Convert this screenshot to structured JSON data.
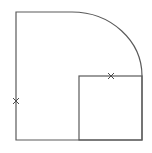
{
  "diagram": {
    "colors": {
      "background": "#ffffff",
      "line": "#5a5a5a",
      "marker": "#4a4a4a"
    },
    "stroke_width": 1.2,
    "outer_shape": {
      "top_left": [
        16,
        12
      ],
      "arc_start": [
        72,
        12
      ],
      "arc_end": [
        142,
        76
      ],
      "arc_radii": [
        70,
        64
      ],
      "bottom_right": [
        142,
        140
      ],
      "bottom_left": [
        16,
        140
      ]
    },
    "inner_square": {
      "x": 79,
      "y": 76,
      "width": 63,
      "height": 64
    },
    "markers": [
      {
        "name": "left-edge-marker",
        "symbol": "×",
        "x": 16,
        "y": 101
      },
      {
        "name": "inner-square-top-marker",
        "symbol": "×",
        "x": 111,
        "y": 76
      }
    ]
  }
}
